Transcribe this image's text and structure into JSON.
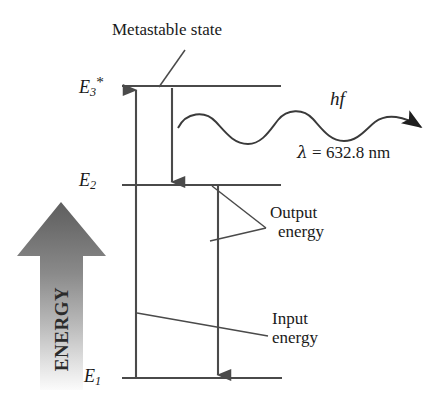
{
  "figure": {
    "type": "energy-level-diagram",
    "width": 444,
    "height": 408,
    "background_color": "#ffffff",
    "line_color": "#4a4a4a",
    "text_color": "#1a1a1a"
  },
  "energy_levels": [
    {
      "id": "E3",
      "label_base": "E",
      "label_sub": "3",
      "label_sup": "*",
      "name": "metastable-level",
      "y": 86,
      "x_start": 122,
      "x_end": 281
    },
    {
      "id": "E2",
      "label_base": "E",
      "label_sub": "2",
      "label_sup": "",
      "name": "intermediate-level",
      "y": 185,
      "x_start": 122,
      "x_end": 281
    },
    {
      "id": "E1",
      "label_base": "E",
      "label_sub": "1",
      "label_sup": "",
      "name": "ground-level",
      "y": 378,
      "x_start": 122,
      "x_end": 282
    }
  ],
  "transitions": [
    {
      "name": "pump-transition",
      "direction": "up",
      "from": "E1",
      "to": "E3",
      "x": 136,
      "y_start": 378,
      "y_end": 90
    },
    {
      "name": "nonradiative-decay",
      "direction": "down",
      "from": "E3",
      "to": "E2",
      "x": 172,
      "y_start": 88,
      "y_end": 182
    },
    {
      "name": "lasing-transition",
      "direction": "down",
      "from": "E2",
      "to": "E1",
      "x": 218,
      "y_start": 186,
      "y_end": 375
    }
  ],
  "photon": {
    "name": "emitted-photon-wave",
    "start_x": 178,
    "start_y": 127,
    "end_x": 435,
    "end_y": 127,
    "energy_label": "hf",
    "wavelength_label": {
      "symbol": "λ",
      "equals": "=",
      "value": "632.8",
      "unit": "nm",
      "full": "λ = 632.8 nm"
    }
  },
  "callouts": [
    {
      "name": "metastable-state-callout",
      "text": "Metastable state",
      "label_x": 112,
      "label_y": 20,
      "leader_from": [
        183,
        52
      ],
      "leader_to": [
        160,
        88
      ]
    },
    {
      "name": "output-energy-callout",
      "line1": "Output",
      "line2": "energy",
      "label_x": 270,
      "label_y": 203
    },
    {
      "name": "input-energy-callout",
      "line1": "Input",
      "line2": "energy",
      "label_x": 272,
      "label_y": 309
    }
  ],
  "energy_axis": {
    "name": "energy-direction-arrow",
    "word": "ENERGY",
    "direction": "up",
    "gradient_top_color": "#6e6e6e",
    "gradient_bottom_color": "#f2f2f2"
  }
}
